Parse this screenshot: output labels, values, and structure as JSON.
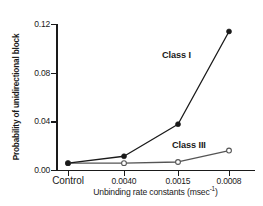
{
  "chart_data": {
    "type": "line",
    "title": "",
    "xlabel": "Unbinding rate constants (msec-1)",
    "xlabel_base": "Unbinding rate constants (msec",
    "xlabel_sup": "-1",
    "xlabel_tail": ")",
    "ylabel": "Probability of unidirectional block",
    "categories": [
      "Control",
      "0.0040",
      "0.0015",
      "0.0008"
    ],
    "xtick_labels": [
      "Control",
      "0.0040",
      "0.0015",
      "0.0008"
    ],
    "ytick_labels": [
      "0.00",
      "0.04",
      "0.08",
      "0.12"
    ],
    "ytick_values": [
      0.0,
      0.04,
      0.08,
      0.12
    ],
    "ylim": [
      0.0,
      0.1275
    ],
    "grid": false,
    "legend_position": "inline-annotation",
    "series": [
      {
        "name": "Class I",
        "marker": "filled-circle",
        "color": "#1a1a1a",
        "values": [
          0.006,
          0.012,
          0.04,
          0.121
        ]
      },
      {
        "name": "Class III",
        "marker": "open-circle",
        "color": "#555555",
        "values": [
          0.006,
          0.006,
          0.007,
          0.017
        ]
      }
    ],
    "annotations": [
      {
        "text": "Class I",
        "series": "Class I"
      },
      {
        "text": "Class III",
        "series": "Class III"
      }
    ]
  },
  "colors": {
    "axis": "#1a1a1a",
    "class_i": "#1a1a1a",
    "class_iii": "#555555",
    "background": "#ffffff"
  }
}
